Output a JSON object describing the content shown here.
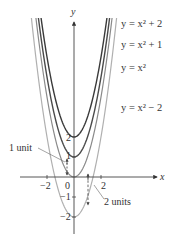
{
  "chart_data": {
    "type": "line",
    "title": "",
    "xlabel": "x",
    "ylabel": "y",
    "xlim": [
      -3.2,
      3.1
    ],
    "ylim": [
      -2.8,
      8.8
    ],
    "grid": false,
    "x_ticks": [
      {
        "value": -2,
        "label": "−2"
      },
      {
        "value": 0,
        "label": "0"
      },
      {
        "value": 2,
        "label": "2"
      }
    ],
    "y_ticks": [
      {
        "value": 2,
        "label": "2"
      },
      {
        "value": 1,
        "label": "1"
      },
      {
        "value": -1,
        "label": "−1"
      },
      {
        "value": -2,
        "label": "−2"
      }
    ],
    "series": [
      {
        "name": "y = x² + 2",
        "formula": "x^2 + 2",
        "shift": 2,
        "color": "#3a3a3a"
      },
      {
        "name": "y = x² + 1",
        "formula": "x^2 + 1",
        "shift": 1,
        "color": "#4a4a4a"
      },
      {
        "name": "y = x²",
        "formula": "x^2",
        "shift": 0,
        "color": "#8a8a8a"
      },
      {
        "name": "y = x² − 2",
        "formula": "x^2 - 2",
        "shift": -2,
        "color": "#b0b0b0"
      }
    ],
    "annotations": [
      {
        "text": "1 unit",
        "description": "dashed double arrow between y=x² and y=x²+1 near x=-0.5"
      },
      {
        "text": "2 units",
        "description": "dashed arrow from y=x² down to y=x²−2 near x=1"
      }
    ]
  },
  "labels": {
    "curve_plus2": "y = x² + 2",
    "curve_plus1": "y = x² + 1",
    "curve_base": "y = x²",
    "curve_minus2": "y = x² − 2",
    "axis_x": "x",
    "axis_y": "y",
    "tick_x_neg2": "−2",
    "tick_x_0": "0",
    "tick_x_2": "2",
    "tick_y_2": "2",
    "tick_y_1": "1",
    "tick_y_neg1": "−1",
    "tick_y_neg2": "−2",
    "note_1unit": "1 unit",
    "note_2units": "2 units"
  }
}
